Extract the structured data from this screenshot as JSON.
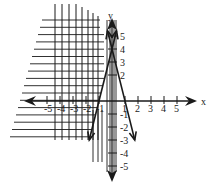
{
  "chart_data": {
    "type": "line",
    "title": "",
    "xlabel": "x",
    "ylabel": "y",
    "xlim": [
      -5,
      5
    ],
    "ylim": [
      -5,
      5
    ],
    "grid": false,
    "x_ticks": [
      -5,
      -4,
      -3,
      -2,
      -1,
      1,
      2,
      3,
      4,
      5
    ],
    "x_tick_labels": [
      "-5",
      "-4",
      "-3",
      "-2",
      "-1",
      "1",
      "2",
      "3",
      "4",
      "5"
    ],
    "y_ticks": [
      5,
      4,
      3,
      2,
      -1,
      -2,
      -3,
      -4,
      -5
    ],
    "y_tick_labels": [
      "5",
      "4",
      "3",
      "2",
      "-1",
      "-2",
      "-3",
      "-4",
      "-5"
    ],
    "series": [
      {
        "name": "y = 4x + 4",
        "slope": 4,
        "intercept": 4,
        "x_range": [
          -1.75,
          0.35
        ],
        "style": "solid",
        "arrows": "both"
      },
      {
        "name": "y = -4x + 4",
        "slope": -4,
        "intercept": 4,
        "x_range": [
          -0.35,
          1.75
        ],
        "style": "solid",
        "arrows": "both"
      }
    ],
    "shading": [
      {
        "name": "vertical-hatch",
        "description": "region left of y = 4x + 4",
        "pattern": "vertical lines"
      },
      {
        "name": "horizontal-hatch",
        "description": "region to the left",
        "pattern": "horizontal lines"
      }
    ],
    "intersection": {
      "x": 0,
      "y": 4
    }
  },
  "colors": {
    "ink": "#1a1a1a",
    "background": "#ffffff"
  }
}
